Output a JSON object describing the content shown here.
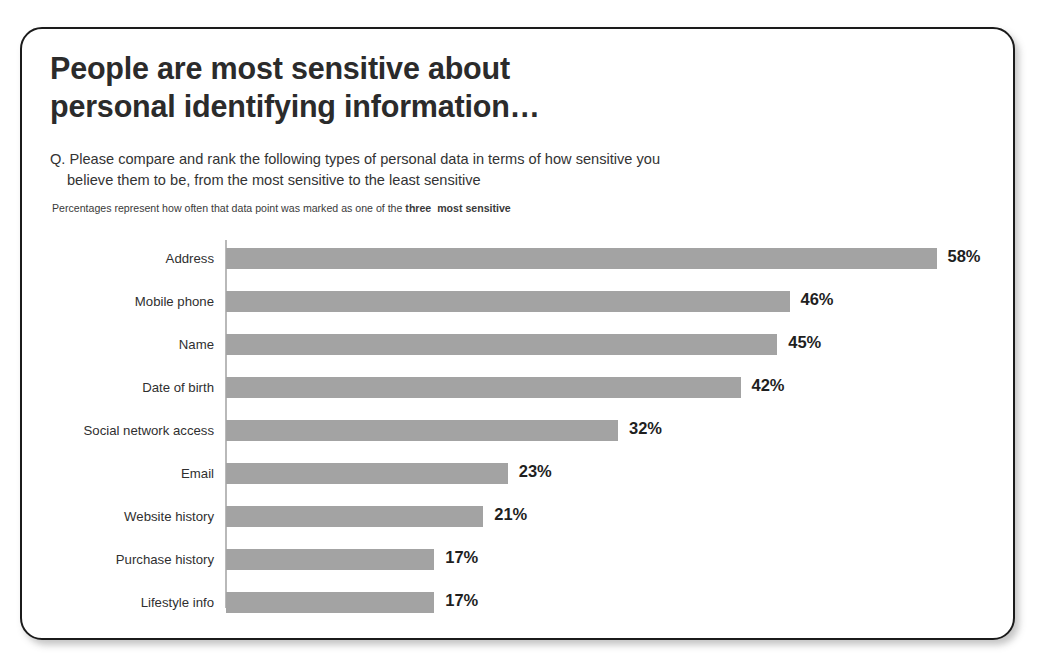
{
  "slide": {
    "title_line_1": "People are most sensitive about",
    "title_line_2": "personal identifying information…",
    "question_line_1": "Q. Please compare and rank the following types of personal data in terms of how sensitive you",
    "question_line_2": "believe them to be, from the most sensitive to the least sensitive",
    "footnote_prefix": "Percentages represent how often that data point was marked as one of the ",
    "footnote_bold": "three  most sensitive",
    "colors": {
      "bar": "#a3a3a3",
      "border": "#1b1b1b",
      "title_text": "#2b2b2b",
      "axis": "#b9b9b9"
    }
  },
  "chart_data": {
    "type": "bar",
    "orientation": "horizontal",
    "title": "People are most sensitive about personal identifying information…",
    "subtitle": "Q. Please compare and rank the following types of personal data in terms of how sensitive you believe them to be, from the most sensitive to the least sensitive",
    "annotation": "Percentages represent how often that data point was marked as one of the three  most sensitive",
    "categories": [
      "Address",
      "Mobile phone",
      "Name",
      "Date of birth",
      "Social network access",
      "Email",
      "Website history",
      "Purchase history",
      "Lifestyle info"
    ],
    "values": [
      58,
      46,
      45,
      42,
      32,
      23,
      21,
      17,
      17
    ],
    "labels": [
      "58%",
      "46%",
      "45%",
      "42%",
      "32%",
      "23%",
      "21%",
      "17%",
      "17%"
    ],
    "xlabel": "",
    "ylabel": "",
    "xlim": [
      0,
      58
    ],
    "grid": false,
    "legend": false,
    "units": "percent"
  }
}
